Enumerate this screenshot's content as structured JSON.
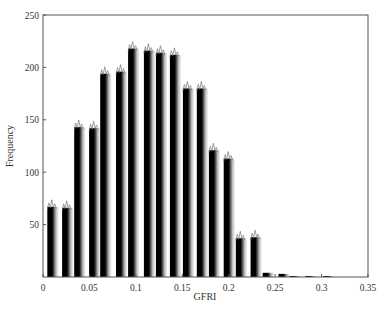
{
  "chart_data": {
    "type": "bar",
    "title": "",
    "xlabel": "GFRI",
    "ylabel": "Frequency",
    "xlim": [
      0,
      0.35
    ],
    "ylim": [
      0,
      250
    ],
    "xticks": [
      0,
      0.05,
      0.1,
      0.15,
      0.2,
      0.25,
      0.3,
      0.35
    ],
    "xtick_labels": [
      "0",
      "0.05",
      "0.1",
      "0.15",
      "0.2",
      "0.25",
      "0.3",
      "0.35"
    ],
    "yticks": [
      50,
      100,
      150,
      200,
      250
    ],
    "ytick_labels": [
      "50",
      "100",
      "150",
      "200",
      "250"
    ],
    "grid": false,
    "legend": null,
    "bin_width": 0.0125,
    "x": [
      0.01,
      0.026,
      0.039,
      0.055,
      0.067,
      0.084,
      0.097,
      0.114,
      0.127,
      0.142,
      0.156,
      0.171,
      0.184,
      0.2,
      0.213,
      0.229,
      0.242,
      0.259,
      0.271,
      0.288,
      0.307
    ],
    "values": [
      67,
      66,
      143,
      142,
      194,
      196,
      218,
      216,
      214,
      212,
      180,
      180,
      121,
      113,
      37,
      38,
      4,
      3,
      1,
      1,
      1
    ],
    "bar_style": "black stripe fading to white gradient",
    "colors": {
      "bar_dark": "#000000",
      "bar_light": "#ffffff",
      "axis": "#555555"
    }
  }
}
